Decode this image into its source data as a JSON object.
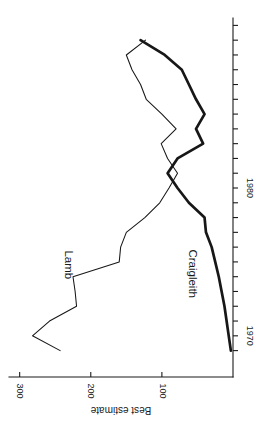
{
  "chart_data": {
    "type": "line",
    "title": "",
    "subtitle": "",
    "xlabel": "",
    "ylabel": "Best estimate",
    "xlim": [
      1968.5,
      1991.5
    ],
    "ylim": [
      0,
      315
    ],
    "xticks": [
      1970,
      1980
    ],
    "xtick_labels": [
      "1970",
      "1980"
    ],
    "xtick_minor_step": 1,
    "yticks": [
      100,
      200,
      300
    ],
    "ytick_labels": [
      "100",
      "200",
      "300"
    ],
    "grid": false,
    "legend_position": "inline-annotations",
    "rotation_degrees": 90,
    "orientation_note": "Figure is printed rotated 90 degrees on the page; x-axis (years) runs vertically at right, y-axis (Best estimate) runs horizontally at bottom.",
    "annotations": [
      {
        "text": "Lamb",
        "series": "Lamb",
        "x": 1974.8,
        "y": 232
      },
      {
        "text": "Craigleith",
        "series": "Craigleith",
        "x": 1974.2,
        "y": 58
      }
    ],
    "series": [
      {
        "name": "Lamb",
        "style": "thin",
        "x": [
          1969,
          1970,
          1971,
          1972,
          1973,
          1974,
          1975,
          1976,
          1977,
          1978,
          1979,
          1980,
          1981,
          1982,
          1983,
          1984,
          1985,
          1986,
          1987,
          1988,
          1989,
          1990
        ],
        "values": [
          243,
          282,
          258,
          220,
          222,
          225,
          160,
          158,
          150,
          124,
          103,
          90,
          78,
          92,
          101,
          80,
          100,
          122,
          130,
          142,
          150,
          123
        ]
      },
      {
        "name": "Craigleith",
        "style": "thick",
        "x": [
          1969,
          1970,
          1971,
          1972,
          1973,
          1974,
          1975,
          1976,
          1977,
          1978,
          1979,
          1980,
          1981,
          1982,
          1983,
          1984,
          1985,
          1986,
          1987,
          1988,
          1989,
          1990
        ],
        "values": [
          3,
          6,
          9,
          12,
          16,
          20,
          25,
          30,
          38,
          40,
          62,
          78,
          92,
          78,
          42,
          52,
          40,
          52,
          62,
          72,
          96,
          130
        ]
      }
    ]
  }
}
